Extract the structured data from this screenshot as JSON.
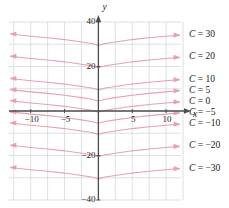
{
  "figure": {
    "axis_labels": {
      "x": "x",
      "y": "y"
    },
    "x_ticks": [
      {
        "value": -10,
        "label": "−10"
      },
      {
        "value": -5,
        "label": "−5"
      },
      {
        "value": 5,
        "label": "5"
      },
      {
        "value": 10,
        "label": "10"
      }
    ],
    "y_ticks": [
      {
        "value": 40,
        "label": "40"
      },
      {
        "value": 20,
        "label": "20"
      },
      {
        "value": -20,
        "label": "−20"
      },
      {
        "value": -40,
        "label": "−40"
      }
    ],
    "curve_labels": [
      {
        "text": "C = 30",
        "C": 30
      },
      {
        "text": "C = 20",
        "C": 20
      },
      {
        "text": "C = 10",
        "C": 10
      },
      {
        "text": "C = 5",
        "C": 5
      },
      {
        "text": "C = 0",
        "C": 0
      },
      {
        "text": "C = −5",
        "C": -5
      },
      {
        "text": "C = −10",
        "C": -10
      },
      {
        "text": "C = −20",
        "C": -20
      },
      {
        "text": "C = −30",
        "C": -30
      }
    ],
    "colors": {
      "curve": "#e8a0b4",
      "axis": "#4d4d4d",
      "grid": "#cfd6d6",
      "text": "#1a1a1a",
      "background": "#ffffff"
    }
  },
  "chart_data": {
    "type": "line",
    "title": "",
    "xlabel": "x",
    "ylabel": "y",
    "xlim": [
      -13.2,
      12.2
    ],
    "ylim": [
      -40,
      40
    ],
    "grid": true,
    "legend": "right-inline-labels",
    "x_tick_values": [
      -10,
      -5,
      5,
      10
    ],
    "y_tick_values": [
      -40,
      -20,
      20,
      40
    ],
    "x_gridline_values": [
      -12.5,
      -10,
      -7.5,
      -5,
      -2.5,
      0,
      2.5,
      5,
      7.5,
      10,
      12.5
    ],
    "y_gridline_values": [
      -40,
      -30,
      -20,
      -10,
      0,
      10,
      20,
      30,
      40
    ],
    "annotations": [
      "Arrowheads on both ends of each curve indicating curves continue"
    ],
    "series": [
      {
        "name": "C = 30",
        "C": 30,
        "x": [
          -13,
          -10,
          -7.5,
          -5,
          -2.5,
          -1,
          0,
          1,
          2.5,
          5,
          7.5,
          10,
          12
        ],
        "values": [
          34.6,
          33.6,
          32.9,
          32.1,
          31.0,
          30.3,
          29.5,
          30.3,
          31.0,
          32.1,
          32.9,
          33.6,
          34.1
        ]
      },
      {
        "name": "C = 20",
        "C": 20,
        "x": [
          -13,
          -10,
          -7.5,
          -5,
          -2.5,
          -1,
          0,
          1,
          2.5,
          5,
          7.5,
          10,
          12
        ],
        "values": [
          24.6,
          23.6,
          22.9,
          22.1,
          21.0,
          20.3,
          19.5,
          20.3,
          21.0,
          22.1,
          22.9,
          23.6,
          24.1
        ]
      },
      {
        "name": "C = 10",
        "C": 10,
        "x": [
          -13,
          -10,
          -7.5,
          -5,
          -2.5,
          -1,
          0,
          1,
          2.5,
          5,
          7.5,
          10,
          12
        ],
        "values": [
          14.6,
          13.6,
          12.9,
          12.1,
          11.0,
          10.3,
          9.5,
          10.3,
          11.0,
          12.1,
          12.9,
          13.6,
          14.1
        ]
      },
      {
        "name": "C = 5",
        "C": 5,
        "x": [
          -13,
          -10,
          -7.5,
          -5,
          -2.5,
          -1,
          0,
          1,
          2.5,
          5,
          7.5,
          10,
          12
        ],
        "values": [
          9.6,
          8.6,
          7.9,
          7.1,
          6.0,
          5.3,
          4.5,
          5.3,
          6.0,
          7.1,
          7.9,
          8.6,
          9.1
        ]
      },
      {
        "name": "C = 0",
        "C": 0,
        "x": [
          -13,
          -10,
          -7.5,
          -5,
          -2.5,
          -1,
          0,
          1,
          2.5,
          5,
          7.5,
          10,
          12
        ],
        "values": [
          4.6,
          3.6,
          2.9,
          2.1,
          1.0,
          0.3,
          -0.5,
          0.3,
          1.0,
          2.1,
          2.9,
          3.6,
          4.1
        ]
      },
      {
        "name": "C = -5",
        "C": -5,
        "x": [
          -13,
          -10,
          -7.5,
          -5,
          -2.5,
          -1,
          0,
          1,
          2.5,
          5,
          7.5,
          10,
          12
        ],
        "values": [
          -0.4,
          -1.4,
          -2.1,
          -2.9,
          -4.0,
          -4.7,
          -5.5,
          -4.7,
          -4.0,
          -2.9,
          -2.1,
          -1.4,
          -0.9
        ]
      },
      {
        "name": "C = -10",
        "C": -10,
        "x": [
          -13,
          -10,
          -7.5,
          -5,
          -2.5,
          -1,
          0,
          1,
          2.5,
          5,
          7.5,
          10,
          12
        ],
        "values": [
          -5.4,
          -6.4,
          -7.1,
          -7.9,
          -9.0,
          -9.7,
          -10.5,
          -9.7,
          -9.0,
          -7.9,
          -7.1,
          -6.4,
          -5.9
        ]
      },
      {
        "name": "C = -20",
        "C": -20,
        "x": [
          -13,
          -10,
          -7.5,
          -5,
          -2.5,
          -1,
          0,
          1,
          2.5,
          5,
          7.5,
          10,
          12
        ],
        "values": [
          -15.4,
          -16.4,
          -17.1,
          -17.9,
          -19.0,
          -19.7,
          -20.5,
          -19.7,
          -19.0,
          -17.9,
          -17.1,
          -16.4,
          -15.9
        ]
      },
      {
        "name": "C = -30",
        "C": -30,
        "x": [
          -13,
          -10,
          -7.5,
          -5,
          -2.5,
          -1,
          0,
          1,
          2.5,
          5,
          7.5,
          10,
          12
        ],
        "values": [
          -25.4,
          -26.4,
          -27.1,
          -27.9,
          -29.0,
          -29.7,
          -30.5,
          -29.7,
          -29.0,
          -27.9,
          -27.1,
          -26.4,
          -25.9
        ]
      }
    ]
  }
}
